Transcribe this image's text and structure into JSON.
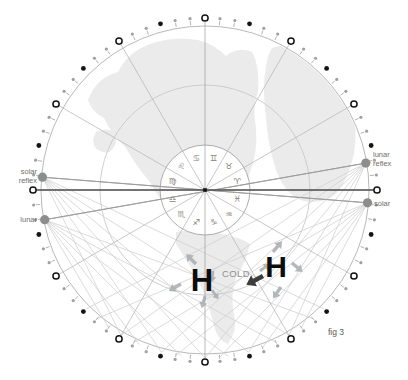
{
  "figure_caption": "fig 3",
  "pressure_systems": {
    "left_high": "H",
    "right_high": "H",
    "cold_label": "COLD"
  },
  "point_labels": {
    "solar_reflex": [
      "solar",
      "reflex"
    ],
    "lunar_left": [
      "lunar"
    ],
    "lunar_reflex": [
      "lunar",
      "reflex"
    ],
    "solar_right": [
      "solar"
    ]
  },
  "colors": {
    "land": "#ebebeb",
    "outer_circle": "#b0b0b0",
    "middle_circle": "#c8c8c8",
    "inner_circle_stroke": "#a3a3a3",
    "spoke": "#b6b6b6",
    "axis_dark": "#4f4f4f",
    "web_line": "#cfcfcf",
    "web_line_dark": "#9b9b9b",
    "pin_gray": "#a0a0a0",
    "dot_black": "#141414",
    "open_circle_stroke": "#141414",
    "big_point_fill": "#8d8d8d",
    "zodiac_glyph": "#8a8276",
    "arrow_gray": "#a7acae",
    "arrow_dark": "#3d3d3d",
    "label_gray": "#6e6e6e"
  },
  "wheel": {
    "center_x": 205,
    "center_y": 190,
    "outer_r": 164,
    "middle_r": 105,
    "inner_r": 45,
    "dot_ring_r": 172,
    "dot_step_deg": 5,
    "open_circle_step_deg": 30,
    "black_dot_offset_deg": 15,
    "spoke_step_deg": 30,
    "zodiac_glyph_r": 33.5,
    "zodiac": [
      {
        "name": "gemini",
        "glyph": "♊",
        "angle_deg": 15
      },
      {
        "name": "taurus",
        "glyph": "♉",
        "angle_deg": 45
      },
      {
        "name": "aries",
        "glyph": "♈",
        "angle_deg": 75
      },
      {
        "name": "pisces",
        "glyph": "♓",
        "angle_deg": 105
      },
      {
        "name": "aquarius",
        "glyph": "♒",
        "angle_deg": 135
      },
      {
        "name": "capricorn",
        "glyph": "♑",
        "angle_deg": 165
      },
      {
        "name": "sagittarius",
        "glyph": "♐",
        "angle_deg": 195
      },
      {
        "name": "scorpio",
        "glyph": "♏",
        "angle_deg": 225
      },
      {
        "name": "libra",
        "glyph": "♎",
        "angle_deg": 255
      },
      {
        "name": "virgo",
        "glyph": "♍",
        "angle_deg": 285
      },
      {
        "name": "leo",
        "glyph": "♌",
        "angle_deg": 315
      },
      {
        "name": "cancer",
        "glyph": "♋",
        "angle_deg": 345
      }
    ]
  },
  "points": [
    {
      "name": "solar-reflex",
      "angle_deg": 274.5,
      "r": 163,
      "web_targets": [
        94.5,
        135,
        150,
        165,
        180,
        195,
        210
      ]
    },
    {
      "name": "lunar",
      "angle_deg": 259.5,
      "r": 163,
      "web_targets": [
        80.5,
        140,
        155,
        172,
        188,
        203,
        215
      ]
    },
    {
      "name": "lunar-reflex",
      "angle_deg": 80.5,
      "r": 163,
      "web_targets": [
        259.5,
        225,
        210,
        195,
        180,
        165,
        150
      ]
    },
    {
      "name": "solar",
      "angle_deg": 94.5,
      "r": 163,
      "web_targets": [
        274.5,
        220,
        205,
        190,
        175,
        160,
        145
      ]
    }
  ],
  "arrows": [
    {
      "x": 196,
      "y": 264,
      "dir": -135,
      "s": 1.0,
      "kind": "gray"
    },
    {
      "x": 213,
      "y": 271,
      "dir": 95,
      "s": 0.8,
      "kind": "gray"
    },
    {
      "x": 181,
      "y": 284,
      "dir": 150,
      "s": 1.0,
      "kind": "gray"
    },
    {
      "x": 205,
      "y": 296,
      "dir": 105,
      "s": 0.9,
      "kind": "gray"
    },
    {
      "x": 212,
      "y": 290,
      "dir": 55,
      "s": 0.8,
      "kind": "gray"
    },
    {
      "x": 273,
      "y": 252,
      "dir": -50,
      "s": 1.0,
      "kind": "gray"
    },
    {
      "x": 292,
      "y": 263,
      "dir": 40,
      "s": 1.0,
      "kind": "gray"
    },
    {
      "x": 281,
      "y": 287,
      "dir": 125,
      "s": 1.0,
      "kind": "gray"
    },
    {
      "x": 260,
      "y": 271,
      "dir": -38,
      "s": 0.85,
      "kind": "gray"
    },
    {
      "x": 263,
      "y": 276,
      "dir": 152,
      "s": 1.35,
      "kind": "dark"
    }
  ]
}
